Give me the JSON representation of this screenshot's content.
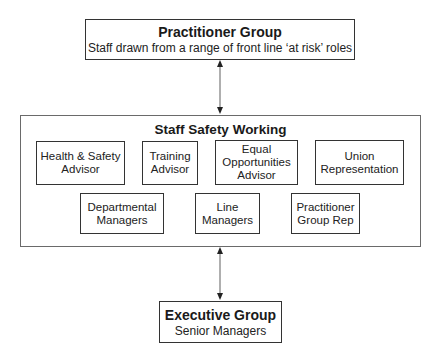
{
  "diagram": {
    "practitioner_group": {
      "title": "Practitioner Group",
      "subtitle": "Staff drawn from a range of front line ‘at risk’ roles"
    },
    "staff_safety_working": {
      "title": "Staff Safety Working",
      "members": [
        {
          "label": "Health & Safety\nAdvisor"
        },
        {
          "label": "Training\nAdvisor"
        },
        {
          "label": "Equal\nOpportunities\nAdvisor"
        },
        {
          "label": "Union\nRepresentation"
        },
        {
          "label": "Departmental\nManagers"
        },
        {
          "label": "Line\nManagers"
        },
        {
          "label": "Practitioner\nGroup Rep"
        }
      ]
    },
    "executive_group": {
      "title": "Executive Group",
      "subtitle": "Senior Managers"
    },
    "connectors": [
      {
        "from": "Practitioner Group",
        "to": "Staff Safety Working",
        "type": "bidirectional-arrow"
      },
      {
        "from": "Staff Safety Working",
        "to": "Executive Group",
        "type": "bidirectional-arrow"
      }
    ],
    "colors": {
      "line": "#333333",
      "arrow_shaft": "#7a7a7a",
      "background": "#ffffff"
    }
  }
}
